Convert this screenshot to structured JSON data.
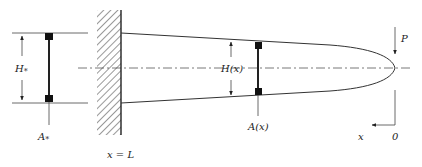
{
  "figure": {
    "colors": {
      "stroke": "#333333",
      "background": "#ffffff"
    }
  },
  "labels": {
    "left_height": "H",
    "left_height_sub": "*",
    "left_area": "A",
    "left_area_sub": "*",
    "mid_height": "H(x)",
    "mid_area": "A(x)",
    "load": "P",
    "axis_x": "x",
    "origin": "0",
    "wall_position": "x = L"
  }
}
